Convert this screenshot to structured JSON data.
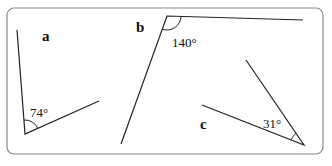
{
  "figure": {
    "frame": {
      "x": 7,
      "y": 8,
      "width": 316,
      "height": 146,
      "radius": 7,
      "stroke": "#8a8a8a"
    },
    "line_color": "#222222",
    "angles": [
      {
        "id": "a",
        "label": "a",
        "label_pos": [
          42,
          41
        ],
        "degree_text": "74°",
        "degree_pos": [
          30,
          117
        ],
        "vertex": [
          25,
          134
        ],
        "arm1": [
          17,
          30
        ],
        "arm2": [
          99,
          101
        ],
        "arc_radius": 14
      },
      {
        "id": "b",
        "label": "b",
        "label_pos": [
          136,
          32
        ],
        "degree_text": "140°",
        "degree_pos": [
          172,
          47
        ],
        "vertex": [
          167,
          16
        ],
        "arm1": [
          121,
          144
        ],
        "arm2": [
          303,
          20
        ],
        "arc_radius": 14
      },
      {
        "id": "c",
        "label": "c",
        "label_pos": [
          200,
          129
        ],
        "degree_text": "31°",
        "degree_pos": [
          263,
          128
        ],
        "vertex": [
          304,
          145
        ],
        "arm1": [
          246,
          60
        ],
        "arm2": [
          202,
          105
        ],
        "arc_radius": 14
      }
    ]
  }
}
